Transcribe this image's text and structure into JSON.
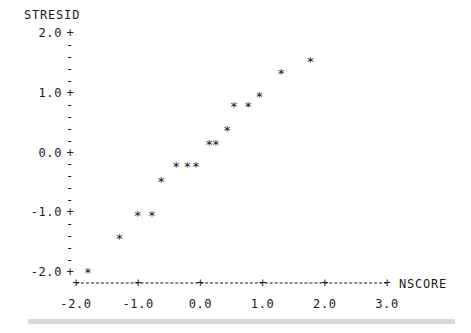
{
  "chart_data": {
    "type": "scatter",
    "title": "",
    "xlabel": "NSCORE",
    "ylabel": "STRESID",
    "xlim": [
      -2.4,
      3.3
    ],
    "ylim": [
      -2.2,
      2.15
    ],
    "grid": false,
    "legend": null,
    "marker": "*",
    "x_ticks": [
      "-2.0",
      "-1.0",
      "0.0",
      "1.0",
      "2.0",
      "3.0"
    ],
    "x_tick_values": [
      -2.0,
      -1.0,
      0.0,
      1.0,
      2.0,
      3.0
    ],
    "y_ticks": [
      "2.0",
      "1.0",
      "0.0",
      "-1.0",
      "-2.0"
    ],
    "y_tick_values": [
      2.0,
      1.0,
      0.0,
      -1.0,
      -2.0
    ],
    "y_minor_ticks_per_interval": 4,
    "axis_style": "character-plot-dashed",
    "points": [
      {
        "x": -1.81,
        "y": -2.0
      },
      {
        "x": -1.3,
        "y": -1.43
      },
      {
        "x": -1.01,
        "y": -1.05
      },
      {
        "x": -0.78,
        "y": -1.05
      },
      {
        "x": -0.63,
        "y": -0.48
      },
      {
        "x": -0.39,
        "y": -0.23
      },
      {
        "x": -0.21,
        "y": -0.23
      },
      {
        "x": -0.07,
        "y": -0.23
      },
      {
        "x": 0.14,
        "y": 0.15
      },
      {
        "x": 0.25,
        "y": 0.15
      },
      {
        "x": 0.43,
        "y": 0.37
      },
      {
        "x": 0.54,
        "y": 0.77
      },
      {
        "x": 0.77,
        "y": 0.77
      },
      {
        "x": 0.95,
        "y": 0.95
      },
      {
        "x": 1.3,
        "y": 1.33
      },
      {
        "x": 1.77,
        "y": 1.53
      }
    ],
    "n_points": 16
  },
  "plot": {
    "ylabel_text": "STRESID",
    "xlabel_text": "NSCORE",
    "major_tick_glyph": "+",
    "minor_tick_glyph": "-",
    "marker_glyph": "*",
    "axis_color": "#1a1a1a"
  }
}
